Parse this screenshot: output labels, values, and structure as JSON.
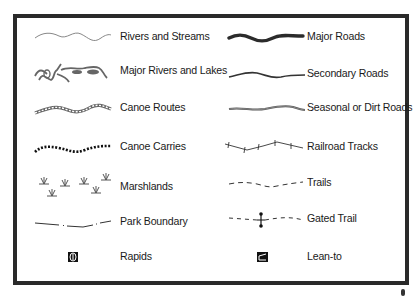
{
  "legend": {
    "left_column": [
      {
        "label": "Rivers and Streams",
        "symbol": "wavy-thin-gray-line"
      },
      {
        "label": "Major Rivers and Lakes",
        "symbol": "river-lake-shape"
      },
      {
        "label": "Canoe Routes",
        "symbol": "chain-line"
      },
      {
        "label": "Canoe Carries",
        "symbol": "dotted-line"
      },
      {
        "label": "Marshlands",
        "symbol": "marsh-grass-tufts"
      },
      {
        "label": "Park Boundary",
        "symbol": "dash-dot-line"
      },
      {
        "label": "Rapids",
        "symbol": "rapids-icon"
      }
    ],
    "right_column": [
      {
        "label": "Major Roads",
        "symbol": "thick-wavy-line"
      },
      {
        "label": "Secondary Roads",
        "symbol": "medium-wavy-line"
      },
      {
        "label": "Seasonal or Dirt Roads",
        "symbol": "double-gray-line"
      },
      {
        "label": "Railroad Tracks",
        "symbol": "tick-line"
      },
      {
        "label": "Trails",
        "symbol": "dashed-line"
      },
      {
        "label": "Gated Trail",
        "symbol": "dashed-line-with-gate"
      },
      {
        "label": "Lean-to",
        "symbol": "lean-to-icon"
      }
    ]
  },
  "colors": {
    "frame": "#2a2a2a",
    "water": "#777777",
    "road": "#2b2b2b",
    "text": "#1a1a1a"
  }
}
